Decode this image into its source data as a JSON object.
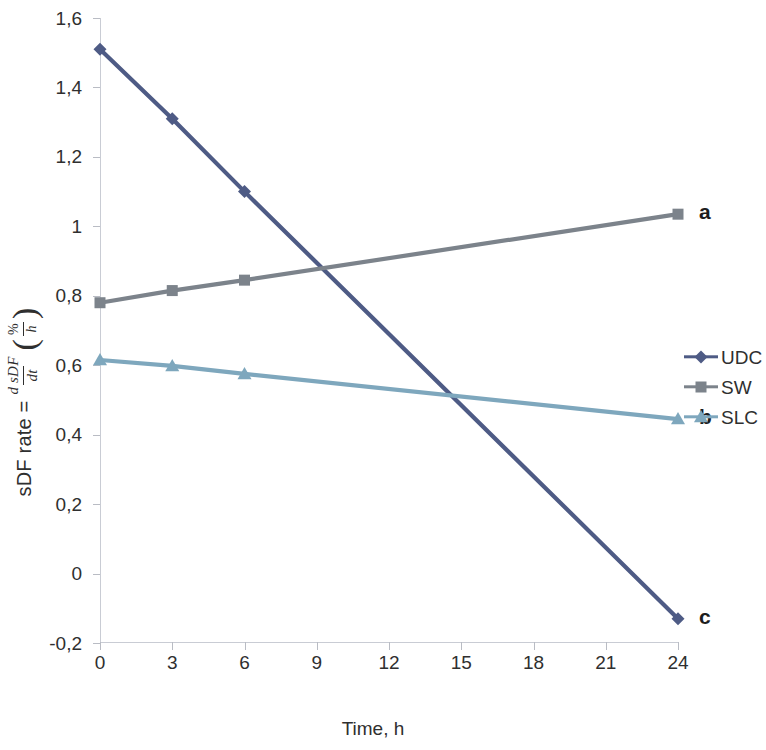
{
  "chart_data": {
    "type": "line",
    "title": "",
    "xlabel": "Time, h",
    "ylabel": "sDF rate = d sDF / dt  (%/h)",
    "ylabel_parts": {
      "lead": "sDF rate =",
      "fraction_numerator": "d sDF",
      "fraction_denominator": "dt",
      "unit_numerator": "%",
      "unit_denominator": "h",
      "paren_open": "(",
      "paren_close": ")"
    },
    "x": [
      0,
      3,
      6,
      24
    ],
    "xtick_labels": [
      "0",
      "3",
      "6",
      "9",
      "12",
      "15",
      "18",
      "21",
      "24"
    ],
    "xtick_values": [
      0,
      3,
      6,
      9,
      12,
      15,
      18,
      21,
      24
    ],
    "ytick_labels": [
      "1,6",
      "1,4",
      "1,2",
      "1",
      "0,8",
      "0,6",
      "0,4",
      "0,2",
      "0",
      "-0,2"
    ],
    "ytick_values": [
      1.6,
      1.4,
      1.2,
      1.0,
      0.8,
      0.6,
      0.4,
      0.2,
      0,
      -0.2
    ],
    "ylim": [
      -0.2,
      1.6
    ],
    "xlim": [
      0,
      24
    ],
    "grid": false,
    "legend_position": "right",
    "series": [
      {
        "name": "UDC",
        "color": "#4e5b85",
        "marker": "diamond",
        "x": [
          0,
          3,
          6,
          24
        ],
        "values": [
          1.51,
          1.31,
          1.1,
          -0.13
        ],
        "end_annotation": "c"
      },
      {
        "name": "SW",
        "color": "#7c838b",
        "marker": "square",
        "x": [
          0,
          3,
          6,
          24
        ],
        "values": [
          0.78,
          0.815,
          0.845,
          1.035
        ],
        "end_annotation": "a"
      },
      {
        "name": "SLC",
        "color": "#7ea7bd",
        "marker": "triangle",
        "x": [
          0,
          3,
          6,
          24
        ],
        "values": [
          0.615,
          0.598,
          0.575,
          0.445
        ],
        "end_annotation": "b"
      }
    ],
    "annotations": [
      {
        "label": "a",
        "series": "SW"
      },
      {
        "label": "b",
        "series": "SLC"
      },
      {
        "label": "c",
        "series": "UDC"
      }
    ]
  },
  "legend": {
    "items": [
      {
        "label": "UDC"
      },
      {
        "label": "SW"
      },
      {
        "label": "SLC"
      }
    ]
  },
  "axis_colors": {
    "axis_line": "#c9ccd4",
    "tick": "#b9bcc4",
    "text": "#2f2f2f"
  }
}
